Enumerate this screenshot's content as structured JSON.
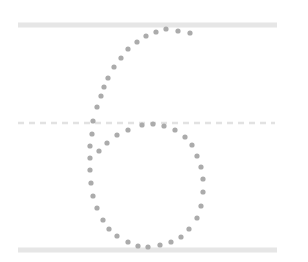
{
  "worksheet": {
    "subject": "handwriting-practice",
    "character": "6",
    "colors": {
      "guide_line": "#e6e6e6",
      "midline": "#e2e2e2",
      "trace_dot": "#ababab",
      "background": "#ffffff"
    },
    "guides": [
      {
        "name": "top-line",
        "style": "solid"
      },
      {
        "name": "mid-line",
        "style": "dashed"
      },
      {
        "name": "base-line",
        "style": "solid"
      }
    ]
  }
}
